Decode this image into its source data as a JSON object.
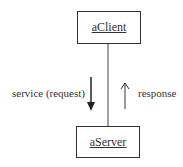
{
  "diagram": {
    "type": "collaboration",
    "objects": [
      {
        "id": "client",
        "label": "aClient"
      },
      {
        "id": "server",
        "label": "aServer"
      }
    ],
    "messages": [
      {
        "label": "service (request)",
        "direction": "down",
        "from": "aClient",
        "to": "aServer"
      },
      {
        "label": "response",
        "direction": "up",
        "from": "aServer",
        "to": "aClient"
      }
    ]
  }
}
